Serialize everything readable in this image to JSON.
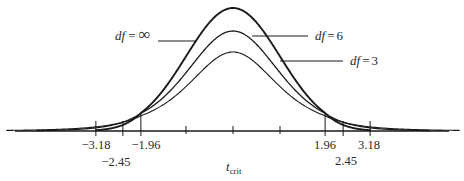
{
  "chart_data": {
    "type": "line",
    "title": "",
    "xlabel": "t_crit",
    "xlabel_main": "t",
    "xlabel_sub": "crit",
    "ylabel": "",
    "series": [
      {
        "name": "df = ∞",
        "df": "inf",
        "label_prefix": "df",
        "label_eq": "=",
        "label_value": "∞",
        "peak": 0.399
      },
      {
        "name": "df = 6",
        "df": 6,
        "label_prefix": "df",
        "label_eq": "=",
        "label_value": "6",
        "peak": 0.383
      },
      {
        "name": "df = 3",
        "df": 3,
        "label_prefix": "df",
        "label_eq": "=",
        "label_value": "3",
        "peak": 0.368
      }
    ],
    "critical_values": [
      {
        "label": "−3.18",
        "value": -3.18,
        "df": 3
      },
      {
        "label": "−2.45",
        "value": -2.45,
        "df": 6
      },
      {
        "label": "−1.96",
        "value": -1.96,
        "df": "inf"
      },
      {
        "label": "1.96",
        "value": 1.96,
        "df": "inf"
      },
      {
        "label": "2.45",
        "value": 2.45,
        "df": 6
      },
      {
        "label": "3.18",
        "value": 3.18,
        "df": 3
      }
    ],
    "minor_ticks": [
      -1,
      0,
      1
    ],
    "grid": false,
    "legend_position": "inline labels with leader lines"
  },
  "colors": {
    "stroke": "#1a1a1a",
    "text": "#2a2a2a",
    "background": "#ffffff"
  }
}
